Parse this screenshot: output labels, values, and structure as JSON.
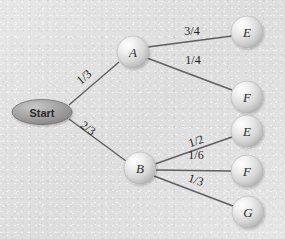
{
  "diagram": {
    "background_color": "#e3e3e3",
    "edge_color": "#5e5e5e",
    "node_fill_color": "#d8d8d8",
    "start_fill_color": "#9b9b9b",
    "label_color": "#1f1f1f"
  },
  "nodes": {
    "start": {
      "label": "Start",
      "shape": "ellipse",
      "cx": 42,
      "cy": 112,
      "rx": 30,
      "ry": 12.5
    },
    "a": {
      "label": "A",
      "shape": "sphere",
      "cx": 133,
      "cy": 52,
      "r": 16
    },
    "b": {
      "label": "B",
      "shape": "sphere",
      "cx": 140,
      "cy": 168,
      "r": 16
    },
    "e1": {
      "label": "E",
      "shape": "sphere",
      "cx": 247,
      "cy": 32,
      "r": 16
    },
    "f1": {
      "label": "F",
      "shape": "sphere",
      "cx": 247,
      "cy": 97,
      "r": 16
    },
    "e2": {
      "label": "E",
      "shape": "sphere",
      "cx": 247,
      "cy": 131,
      "r": 16
    },
    "f2": {
      "label": "F",
      "shape": "sphere",
      "cx": 247,
      "cy": 171,
      "r": 16
    },
    "g1": {
      "label": "G",
      "shape": "sphere",
      "cx": 248,
      "cy": 212,
      "r": 16
    }
  },
  "edges": [
    {
      "id": "start-a",
      "from": "Start",
      "to": "A",
      "label": "1/3",
      "x1": 69,
      "y1": 105,
      "x2": 119,
      "y2": 62,
      "lx": 84,
      "ly": 77,
      "rotate": -40
    },
    {
      "id": "start-b",
      "from": "Start",
      "to": "B",
      "label": "2/3",
      "x1": 69,
      "y1": 119,
      "x2": 126,
      "y2": 161,
      "lx": 88,
      "ly": 128,
      "rotate": 36
    },
    {
      "id": "a-e1",
      "from": "A",
      "to": "E",
      "label": "3/4",
      "x1": 148,
      "y1": 47,
      "x2": 232,
      "y2": 36,
      "lx": 192,
      "ly": 31,
      "rotate": 0
    },
    {
      "id": "a-f1",
      "from": "A",
      "to": "F",
      "label": "1/4",
      "x1": 147,
      "y1": 58,
      "x2": 232,
      "y2": 90,
      "lx": 193,
      "ly": 60,
      "rotate": 0
    },
    {
      "id": "b-e2",
      "from": "B",
      "to": "E",
      "label": "1/2",
      "x1": 155,
      "y1": 164,
      "x2": 232,
      "y2": 137,
      "lx": 196,
      "ly": 141,
      "rotate": -18
    },
    {
      "id": "b-f2",
      "from": "B",
      "to": "F",
      "label": "1/6",
      "x1": 156,
      "y1": 170,
      "x2": 232,
      "y2": 171,
      "lx": 196,
      "ly": 155,
      "rotate": 0
    },
    {
      "id": "b-g1",
      "from": "B",
      "to": "G",
      "label": "1/3",
      "x1": 154,
      "y1": 176,
      "x2": 233,
      "y2": 206,
      "lx": 196,
      "ly": 180,
      "rotate": 19
    }
  ]
}
